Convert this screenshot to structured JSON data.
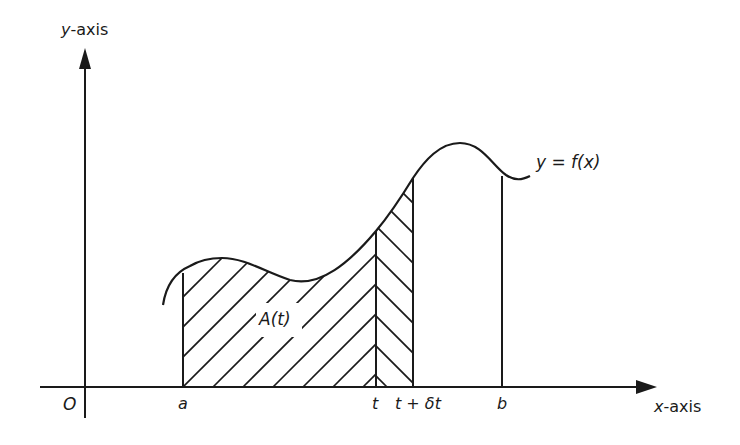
{
  "diagram": {
    "labels": {
      "y_axis": "y-axis",
      "y_axis_var": "y",
      "y_axis_suffix": "-axis",
      "x_axis_var": "x",
      "x_axis_suffix": "-axis",
      "origin": "O",
      "a": "a",
      "t": "t",
      "t_plus_dt": "t + δt",
      "b": "b",
      "curve": "y = f(x)",
      "area": "A(t)"
    },
    "colors": {
      "ink": "#1a1a1a",
      "background": "#ffffff"
    },
    "geometry": {
      "origin_px": [
        84,
        387
      ],
      "x_positions_px": {
        "a": 183,
        "t": 376,
        "t_plus_dt": 413,
        "b": 502
      },
      "curve_heights_px": {
        "a": 273,
        "t": 231,
        "t_plus_dt": 178,
        "b": 175
      }
    }
  }
}
